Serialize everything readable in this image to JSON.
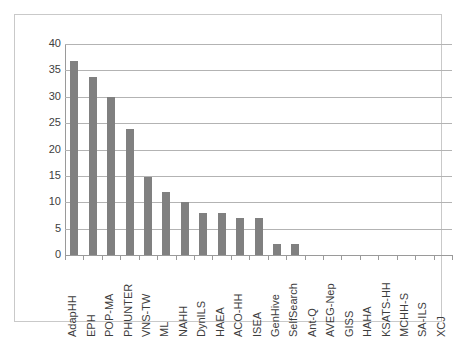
{
  "chart_data": {
    "type": "bar",
    "title": "",
    "subtitle": "",
    "xlabel": "",
    "ylabel": "",
    "ylim": [
      0,
      40
    ],
    "yticks": [
      0,
      5,
      10,
      15,
      20,
      25,
      30,
      35,
      40
    ],
    "ytick_labels": [
      "0",
      "5",
      "10",
      "15",
      "20",
      "25",
      "30",
      "35",
      "40"
    ],
    "grid": true,
    "legend": false,
    "bar_color": "#808080",
    "gridline_color": "#b3b3b3",
    "axis_color": "#9a9a9a",
    "frame_color": "#c9c9c9",
    "categories": [
      "AdapHH",
      "EPH",
      "POP-MA",
      "PHUNTER",
      "VNS-TW",
      "ML",
      "NAHH",
      "DynILS",
      "HAEA",
      "ACO-HH",
      "ISEA",
      "GenHive",
      "SelfSearch",
      "Ant-Q",
      "AVEG-Nep",
      "GISS",
      "HAHA",
      "KSATS-HH",
      "MCHH-S",
      "SA-ILS",
      "XCJ"
    ],
    "values": [
      36.7,
      33.7,
      30.0,
      23.8,
      14.7,
      11.9,
      10.0,
      8.0,
      8.0,
      7.1,
      7.1,
      2.1,
      2.1,
      0,
      0,
      0,
      0,
      0,
      0,
      0,
      0
    ]
  }
}
